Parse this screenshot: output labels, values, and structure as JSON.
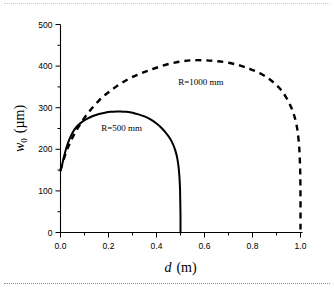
{
  "figure": {
    "width": 334,
    "height": 297,
    "background": "#ffffff",
    "rule_top": "dotted-separator",
    "rule_bottom": "dotted-separator"
  },
  "chart_data": {
    "type": "line",
    "title": "",
    "xlabel_italic": "d",
    "xlabel_units": "(m)",
    "ylabel_italic": "w",
    "ylabel_sub": "0",
    "ylabel_units": "(µm)",
    "xlim": [
      0.0,
      1.0
    ],
    "ylim": [
      0,
      500
    ],
    "xticks": [
      0.0,
      0.2,
      0.4,
      0.6,
      0.8,
      1.0
    ],
    "xtick_labels": [
      "0.0",
      "0.2",
      "0.4",
      "0.6",
      "0.8",
      "1.0"
    ],
    "xminor_step": 0.1,
    "yticks": [
      0,
      100,
      200,
      300,
      400,
      500
    ],
    "ytick_labels": [
      "0",
      "100",
      "200",
      "300",
      "400",
      "500"
    ],
    "yminor_step": 50,
    "grid": false,
    "legend": "inline-annotations",
    "spines": [
      "left",
      "bottom"
    ],
    "series": [
      {
        "name": "R=500 mm",
        "label": "R=500 mm",
        "style": "solid",
        "color": "#000000",
        "annotation_x": 0.255,
        "annotation_y": 243,
        "x": [
          0.0,
          0.002,
          0.005,
          0.008,
          0.012,
          0.018,
          0.025,
          0.035,
          0.05,
          0.07,
          0.09,
          0.11,
          0.135,
          0.16,
          0.185,
          0.21,
          0.235,
          0.25,
          0.275,
          0.3,
          0.325,
          0.35,
          0.375,
          0.4,
          0.42,
          0.44,
          0.455,
          0.468,
          0.478,
          0.486,
          0.492,
          0.496,
          0.498,
          0.499,
          0.5,
          0.5
        ],
        "y": [
          148,
          152,
          158,
          166,
          176,
          190,
          205,
          221,
          240,
          256,
          266,
          273,
          280,
          285,
          288,
          290,
          291,
          291,
          290,
          288,
          284,
          279,
          272,
          262,
          252,
          239,
          227,
          213,
          198,
          180,
          157,
          130,
          105,
          75,
          38,
          0
        ]
      },
      {
        "name": "R=1000 mm",
        "label": "R=1000 mm",
        "style": "dashed",
        "color": "#000000",
        "annotation_x": 0.585,
        "annotation_y": 355,
        "x": [
          0.0,
          0.004,
          0.01,
          0.018,
          0.028,
          0.04,
          0.055,
          0.075,
          0.1,
          0.13,
          0.165,
          0.2,
          0.24,
          0.28,
          0.32,
          0.36,
          0.4,
          0.45,
          0.5,
          0.55,
          0.6,
          0.65,
          0.7,
          0.75,
          0.79,
          0.83,
          0.865,
          0.895,
          0.92,
          0.94,
          0.958,
          0.97,
          0.98,
          0.988,
          0.994,
          0.997,
          0.999,
          1.0,
          1.0
        ],
        "y": [
          150,
          158,
          170,
          184,
          200,
          216,
          234,
          254,
          276,
          298,
          320,
          337,
          354,
          368,
          379,
          388,
          396,
          405,
          411,
          414,
          414,
          412,
          408,
          401,
          393,
          383,
          371,
          357,
          342,
          325,
          305,
          288,
          268,
          243,
          210,
          178,
          140,
          80,
          0
        ]
      }
    ]
  }
}
